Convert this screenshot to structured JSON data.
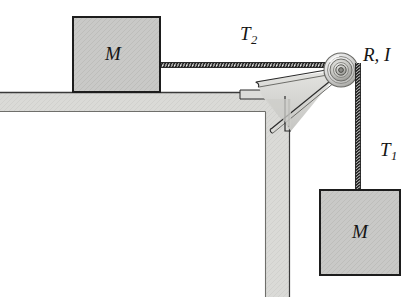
{
  "figure": {
    "kind": "physics-free-body-diagram",
    "background_color": "#ffffff"
  },
  "labels": {
    "tension_upper": "T",
    "tension_upper_sub": "2",
    "tension_lower": "T",
    "tension_lower_sub": "1",
    "pulley": "R, I",
    "block_table": "M",
    "block_hanging": "M"
  },
  "colors": {
    "block_fill": "#c9c9c7",
    "block_border": "#1d1d1d",
    "table_fill": "#d9d9d6",
    "table_edge": "#3a3a3a",
    "bracket_fill": "#d2d2cf",
    "bracket_border": "#2b2b2b",
    "rope": "#2a2a2a",
    "pulley_light": "#f2f2f0",
    "pulley_mid": "#cfcfcc",
    "pulley_dark": "#8e8e8a",
    "text": "#151515"
  },
  "geometry": {
    "pulley_center": [
      341,
      70
    ],
    "pulley_outer_radius": 17,
    "block_table_rect": [
      73,
      17,
      87,
      75
    ],
    "block_hanging_rect": [
      320,
      190,
      80,
      85
    ],
    "table_top_y": 92,
    "table_thickness": 20,
    "table_leg_x": 265,
    "table_leg_width": 25
  },
  "parts": [
    {
      "name": "block-on-table",
      "label": "M"
    },
    {
      "name": "block-hanging",
      "label": "M"
    },
    {
      "name": "pulley",
      "label": "R, I"
    },
    {
      "name": "rope-horizontal",
      "label": "T2"
    },
    {
      "name": "rope-vertical",
      "label": "T1"
    },
    {
      "name": "table",
      "label": ""
    },
    {
      "name": "pulley-bracket",
      "label": ""
    }
  ]
}
